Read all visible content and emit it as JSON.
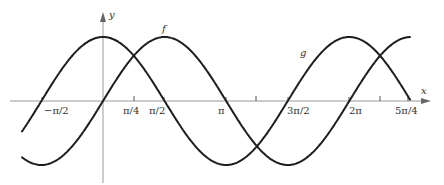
{
  "chart_data": {
    "type": "line",
    "title": "",
    "xlabel": "x",
    "ylabel": "y",
    "grid": false,
    "legend": "inline curve labels",
    "xlim": [
      -2.1,
      7.5
    ],
    "ylim": [
      -1.1,
      1.1
    ],
    "x_ticks": [
      {
        "value": -1.5708,
        "label": "−π/2"
      },
      {
        "value": 0.7854,
        "label": "π/4"
      },
      {
        "value": 1.5708,
        "label": "π/2"
      },
      {
        "value": 3.1416,
        "label": "π"
      },
      {
        "value": 3.927,
        "label": ""
      },
      {
        "value": 4.7124,
        "label": "3π/2"
      },
      {
        "value": 6.2832,
        "label": "2π"
      },
      {
        "value": 7.0686,
        "label": ""
      },
      {
        "value": 7.854,
        "label": "5π/4"
      }
    ],
    "series": [
      {
        "name": "f",
        "function": "sin(x)",
        "x_range": [
          -2.0,
          7.8
        ],
        "label_position_x": 1.5708
      },
      {
        "name": "g",
        "function": "cos(x)",
        "x_range": [
          -2.0,
          7.8
        ],
        "label_position_x": 5.4
      }
    ]
  },
  "labels": {
    "y_axis": "y",
    "x_axis": "x",
    "f": "f",
    "g": "g",
    "tick_neg_pi_2": "−π/2",
    "tick_pi_4": "π/4",
    "tick_pi_2": "π/2",
    "tick_pi": "π",
    "tick_3pi_2": "3π/2",
    "tick_2pi": "2π",
    "tick_5pi_4": "5π/4"
  }
}
